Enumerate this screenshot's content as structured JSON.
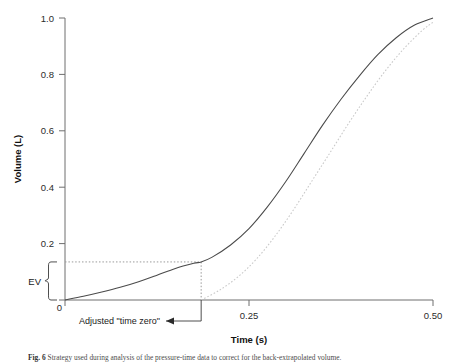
{
  "figure": {
    "caption_label": "Fig. 6",
    "caption_text": "Strategy used during analysis of the pressure-time data to correct for the back-extrapolated volume."
  },
  "axes": {
    "x": {
      "title": "Time (s)",
      "ticks": [
        "0",
        "0.25",
        "0.50"
      ],
      "tick_values": [
        0,
        0.25,
        0.5
      ],
      "range": [
        0,
        0.5
      ]
    },
    "y": {
      "title": "Volume (L)",
      "ticks": [
        "0",
        "0.2",
        "0.4",
        "0.6",
        "0.8",
        "1.0"
      ],
      "tick_values": [
        0,
        0.2,
        0.4,
        0.6,
        0.8,
        1.0
      ],
      "range": [
        0,
        1.0
      ]
    }
  },
  "annotations": {
    "ev_label": "EV",
    "ev_span": [
      0,
      0.135
    ],
    "time_zero_label": "Adjusted \"time zero\"",
    "time_zero_value": 0.185,
    "back_extrapolated_volume": 0.135
  },
  "colors": {
    "curve": "#4a4a4a",
    "curve_shifted": "#c8c8c8",
    "guide": "#9a9a9a",
    "axis": "#6e6e6e",
    "text": "#1a1a1a"
  },
  "chart_data": {
    "type": "line",
    "title": "",
    "xlabel": "Time (s)",
    "ylabel": "Volume (L)",
    "xlim": [
      0,
      0.5
    ],
    "ylim": [
      0,
      1.0
    ],
    "grid": false,
    "legend": "none",
    "series": [
      {
        "name": "Measured volume-time curve",
        "style": "solid",
        "x": [
          0.0,
          0.025,
          0.05,
          0.075,
          0.1,
          0.125,
          0.15,
          0.175,
          0.185,
          0.2,
          0.225,
          0.25,
          0.275,
          0.3,
          0.325,
          0.35,
          0.375,
          0.4,
          0.425,
          0.45,
          0.475,
          0.5
        ],
        "y": [
          0.0,
          0.013,
          0.028,
          0.045,
          0.065,
          0.088,
          0.112,
          0.13,
          0.135,
          0.152,
          0.195,
          0.253,
          0.33,
          0.42,
          0.52,
          0.62,
          0.712,
          0.795,
          0.87,
          0.93,
          0.975,
          1.0
        ]
      },
      {
        "name": "Back-extrapolated (time-zero adjusted) curve",
        "style": "dotted",
        "x": [
          0.185,
          0.21,
          0.235,
          0.26,
          0.285,
          0.31,
          0.335,
          0.36,
          0.385,
          0.41,
          0.435,
          0.46,
          0.485,
          0.5
        ],
        "y": [
          0.0,
          0.035,
          0.082,
          0.145,
          0.225,
          0.318,
          0.42,
          0.522,
          0.625,
          0.722,
          0.812,
          0.89,
          0.955,
          0.985
        ]
      }
    ],
    "guide_lines": [
      {
        "name": "back-extrapolated-volume-line",
        "orientation": "horizontal",
        "value": 0.135,
        "from": 0.0,
        "to": 0.185,
        "style": "dotted"
      },
      {
        "name": "adjusted-time-zero-line",
        "orientation": "vertical",
        "value": 0.185,
        "from": 0.0,
        "to": 0.135,
        "style": "dotted"
      }
    ]
  }
}
